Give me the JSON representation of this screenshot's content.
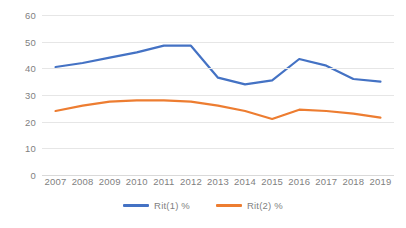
{
  "chart_data": {
    "type": "line",
    "title": "",
    "xlabel": "",
    "ylabel": "",
    "grid": true,
    "legend_position": "bottom",
    "ylim": [
      0,
      60
    ],
    "yticks": [
      0,
      10,
      20,
      30,
      40,
      50,
      60
    ],
    "ytick_labels": [
      "0",
      "10",
      "20",
      "30",
      "40",
      "50",
      "60"
    ],
    "categories": [
      "2007",
      "2008",
      "2009",
      "2010",
      "2011",
      "2012",
      "2013",
      "2014",
      "2015",
      "2016",
      "2017",
      "2018",
      "2019"
    ],
    "series": [
      {
        "name": "Rit(1) %",
        "color": "#4472C4",
        "values": [
          40.5,
          42,
          44,
          46,
          48.5,
          48.5,
          36.5,
          34,
          35.5,
          43.5,
          41,
          36,
          35
        ]
      },
      {
        "name": "Rit(2) %",
        "color": "#ED7D31",
        "values": [
          24,
          26,
          27.5,
          28,
          28,
          27.5,
          26,
          24,
          21,
          24.5,
          24,
          23,
          21.5
        ]
      }
    ]
  },
  "legend": {
    "items": [
      {
        "label": "Rit(1) %",
        "color": "#4472C4",
        "swatch": "line-swatch-blue"
      },
      {
        "label": "Rit(2) %",
        "color": "#ED7D31",
        "swatch": "line-swatch-orange"
      }
    ]
  }
}
